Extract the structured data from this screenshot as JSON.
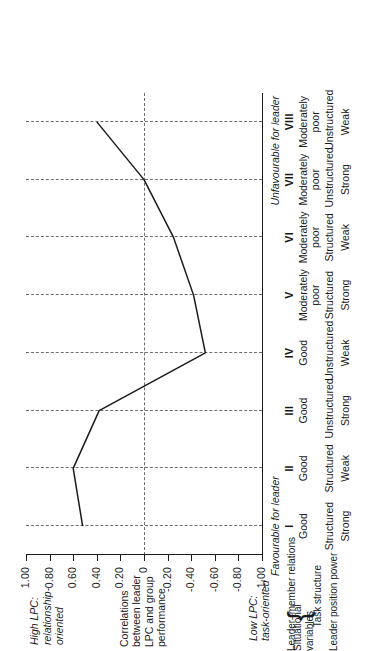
{
  "chart_data": {
    "type": "line",
    "title": "",
    "orientation": "rotated-90ccw",
    "xlabel": "Situational favourableness (octants)",
    "ylabel": "Correlations between leader LPC and group performance",
    "categories": [
      "I",
      "II",
      "III",
      "IV",
      "V",
      "VI",
      "VII",
      "VIII"
    ],
    "values": [
      0.52,
      0.6,
      0.38,
      -0.52,
      -0.42,
      -0.25,
      0.0,
      0.4
    ],
    "ylim": [
      -1.0,
      1.0
    ],
    "yticks": [
      1.0,
      0.8,
      0.6,
      0.4,
      0.2,
      0,
      -0.2,
      -0.4,
      -0.6,
      -0.8,
      -1.0
    ],
    "ytick_labels": [
      "1.00",
      "0.80",
      "0.60",
      "0.40",
      "0.20",
      "0",
      "-0.20",
      "-0.40",
      "-0.60",
      "-0.80",
      "-1.00"
    ],
    "grid": true,
    "zero_reference_line": 0,
    "legend": "none",
    "series": [
      {
        "name": "Correlation between leader LPC and group performance",
        "values": [
          0.52,
          0.6,
          0.38,
          -0.52,
          -0.42,
          -0.25,
          0.0,
          0.4
        ]
      }
    ]
  },
  "axis": {
    "high_label": "High LPC:\nrelationship-\noriented",
    "high_label_lines": [
      "High LPC:",
      "relationship-",
      "oriented"
    ],
    "low_label_lines": [
      "Low LPC:",
      "task-oriented"
    ],
    "centre_label_lines": [
      "Correlations",
      "between leader",
      "LPC and group",
      "performance"
    ]
  },
  "favourability": {
    "favourable": "Favourable for leader",
    "unfavourable": "Unfavourable for leader"
  },
  "table": {
    "group_label_lines": [
      "Situational",
      "variables"
    ],
    "row_labels": [
      "Leader–member relations",
      "Task structure",
      "Leader position power"
    ],
    "octants": [
      "I",
      "II",
      "III",
      "IV",
      "V",
      "VI",
      "VII",
      "VIII"
    ],
    "rows": [
      {
        "label": "Leader–member relations",
        "cells": [
          "Good",
          "Good",
          "Good",
          "Good",
          "Moderately poor",
          "Moderately poor",
          "Moderately poor",
          "Moderately poor"
        ]
      },
      {
        "label": "Task structure",
        "cells": [
          "Structured",
          "Structured",
          "Unstructured",
          "Unstructured",
          "Structured",
          "Structured",
          "Unstructured",
          "Unstructured"
        ]
      },
      {
        "label": "Leader position power",
        "cells": [
          "Strong",
          "Weak",
          "Strong",
          "Weak",
          "Strong",
          "Weak",
          "Strong",
          "Weak"
        ]
      }
    ]
  },
  "colors": {
    "ink": "#1a1a1a",
    "grid": "#6e6e6e",
    "background": "#ffffff"
  }
}
